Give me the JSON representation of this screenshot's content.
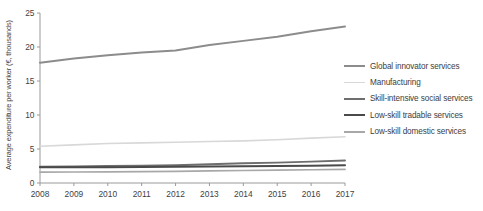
{
  "chart_data": {
    "type": "line",
    "title": "",
    "xlabel": "",
    "ylabel": "Average expenditure per worker (€, thousands)",
    "x": [
      2008,
      2009,
      2010,
      2011,
      2012,
      2013,
      2014,
      2015,
      2016,
      2017
    ],
    "xtick_labels": [
      "2008",
      "2009",
      "2010",
      "2011",
      "2012",
      "2013",
      "2014",
      "2015",
      "2016",
      "2017"
    ],
    "ytick_labels": [
      "0",
      "5",
      "10",
      "15",
      "20",
      "25"
    ],
    "yticks": [
      0,
      5,
      10,
      15,
      20,
      25
    ],
    "ylim": [
      0,
      25
    ],
    "xlim": [
      2008,
      2017
    ],
    "grid": false,
    "legend_position": "right",
    "series": [
      {
        "name": "Global innovator services",
        "color": "#8c8c8c",
        "width": 2.0,
        "values": [
          17.7,
          18.3,
          18.8,
          19.2,
          19.5,
          20.3,
          20.9,
          21.5,
          22.3,
          23.0
        ]
      },
      {
        "name": "Manufacturing",
        "color": "#d8d8d8",
        "width": 1.6,
        "values": [
          5.4,
          5.6,
          5.8,
          5.9,
          6.0,
          6.1,
          6.2,
          6.35,
          6.6,
          6.8
        ]
      },
      {
        "name": "Skill-intensive social services",
        "color": "#6e6e6e",
        "width": 1.9,
        "values": [
          2.4,
          2.45,
          2.5,
          2.55,
          2.6,
          2.75,
          2.9,
          3.0,
          3.15,
          3.3
        ]
      },
      {
        "name": "Low-skill tradable services",
        "color": "#4a4a4a",
        "width": 2.0,
        "values": [
          2.3,
          2.3,
          2.32,
          2.35,
          2.38,
          2.42,
          2.46,
          2.5,
          2.55,
          2.6
        ]
      },
      {
        "name": "Low-skill domestic services",
        "color": "#a8a8a8",
        "width": 1.7,
        "values": [
          1.6,
          1.62,
          1.65,
          1.68,
          1.72,
          1.78,
          1.84,
          1.9,
          1.95,
          2.0
        ]
      }
    ]
  },
  "axis": {
    "color": "#9a9a9a"
  }
}
